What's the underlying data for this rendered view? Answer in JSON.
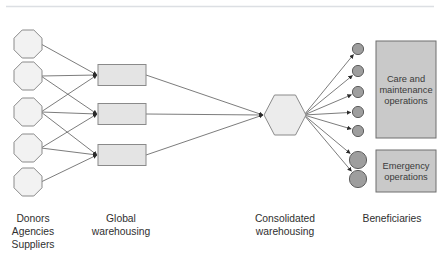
{
  "figure": {
    "type": "supply-chain-flow-diagram",
    "background_color": "#ffffff",
    "top_rule_color": "#d9dce0",
    "stroke_color": "#5a5a5a",
    "line_color": "#6d6d6d"
  },
  "columns": [
    {
      "id": "sources",
      "label_lines": [
        "Donors",
        "Agencies",
        "Suppliers"
      ],
      "label_x": 33,
      "label_y": 222
    },
    {
      "id": "global",
      "label_lines": [
        "Global",
        "warehousing"
      ],
      "label_x": 121,
      "label_y": 222
    },
    {
      "id": "consolidated",
      "label_lines": [
        "Consolidated",
        "warehousing"
      ],
      "label_x": 285,
      "label_y": 222
    },
    {
      "id": "beneficiaries",
      "label_lines": [
        "Beneficiaries"
      ],
      "label_x": 392,
      "label_y": 222
    }
  ],
  "shapes": {
    "octagon": {
      "count": 5,
      "fill": "#f2f2f2",
      "stroke": "#8a8a8a",
      "width": 28,
      "height": 28,
      "cx": 28,
      "cy_values": [
        44,
        76,
        112,
        148,
        182
      ]
    },
    "rectangle": {
      "count": 3,
      "fill": "#e4e4e4",
      "stroke": "#8a8a8a",
      "x": 98,
      "width": 48,
      "height": 21,
      "cy_values": [
        75,
        114,
        155
      ]
    },
    "hexagon": {
      "fill": "#ececec",
      "stroke": "#8a8a8a",
      "cx": 285,
      "cy": 115,
      "rx": 21,
      "ry": 20
    },
    "small_circles": {
      "count": 5,
      "fill": "#9e9e9e",
      "stroke": "#5e5e5e",
      "cx": 358,
      "r": 5.6,
      "cy_values": [
        49,
        71,
        92,
        112,
        131
      ]
    },
    "large_circles": {
      "count": 2,
      "fill": "#9e9e9e",
      "stroke": "#5e5e5e",
      "cx": 358,
      "r": 8.6,
      "cy_values": [
        160,
        179
      ]
    },
    "operation_boxes": [
      {
        "id": "care-and-maintenance",
        "lines": [
          "Care and",
          "maintenance",
          "operations"
        ],
        "fill": "#c9c9c9",
        "stroke": "#6f6f6f",
        "x": 376,
        "y": 41,
        "width": 60,
        "height": 97
      },
      {
        "id": "emergency",
        "lines": [
          "Emergency",
          "operations"
        ],
        "fill": "#c9c9c9",
        "stroke": "#6f6f6f",
        "x": 376,
        "y": 150,
        "width": 60,
        "height": 42
      }
    ]
  },
  "edges": {
    "sources_to_global": [
      {
        "from": 0,
        "to": 0
      },
      {
        "from": 1,
        "to": 0
      },
      {
        "from": 2,
        "to": 0
      },
      {
        "from": 1,
        "to": 1
      },
      {
        "from": 2,
        "to": 1
      },
      {
        "from": 3,
        "to": 1
      },
      {
        "from": 2,
        "to": 2
      },
      {
        "from": 3,
        "to": 2
      },
      {
        "from": 4,
        "to": 2
      }
    ],
    "global_to_consolidated": [
      0,
      1,
      2
    ],
    "consolidated_to_beneficiaries": {
      "small": [
        0,
        1,
        2,
        3,
        4
      ],
      "large": [
        0,
        1
      ]
    }
  }
}
